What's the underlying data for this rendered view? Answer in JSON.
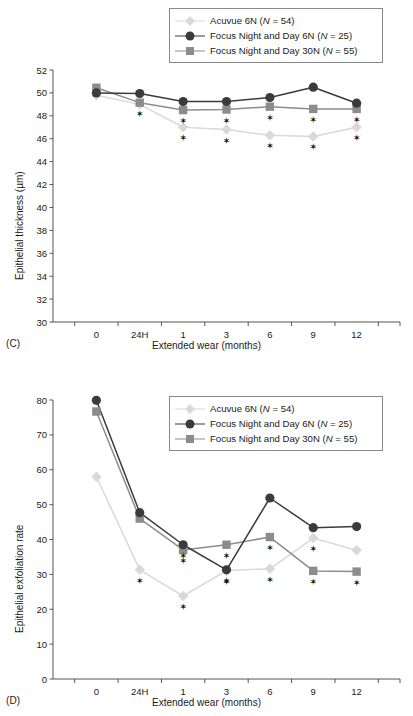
{
  "figure": {
    "panels": [
      {
        "tag": "(C)",
        "chart_key": "panel_c"
      },
      {
        "tag": "(D)",
        "chart_key": "panel_d"
      }
    ]
  },
  "legend": {
    "position": "top-center",
    "entries": [
      {
        "name": "Acuvue 6N",
        "n_prefix": "(",
        "n_italic": "N",
        "n_rest": " = 54)",
        "label": "Acuvue 6N (N = 54)",
        "color": "#d9d9d9",
        "marker": "diamond"
      },
      {
        "name": "Focus Night and Day 6N",
        "n_prefix": "(",
        "n_italic": "N",
        "n_rest": " = 25)",
        "label": "Focus Night and Day 6N (N = 25)",
        "color": "#3b3b3b",
        "marker": "circle"
      },
      {
        "name": "Focus Night and Day 30N",
        "n_prefix": "(",
        "n_italic": "N",
        "n_rest": " = 55)",
        "label": "Focus Night and Day 30N (N = 55)",
        "color": "#8c8c8c",
        "marker": "square"
      }
    ]
  },
  "colors": {
    "acuvue": "#d9d9d9",
    "fnd6n": "#3b3b3b",
    "fnd30n": "#8c8c8c",
    "axis": "#555555",
    "text": "#1a1a1a",
    "legend_border": "#8a8a8a",
    "star": "#111111",
    "background": "#ffffff"
  },
  "chart_data": [
    {
      "id": "panel_c",
      "panel": "(C)",
      "type": "line",
      "title": "",
      "xlabel": "Extended wear (months)",
      "ylabel": "Epithelial thickness (µm)",
      "categories": [
        "0",
        "24H",
        "1",
        "3",
        "6",
        "9",
        "12"
      ],
      "ylim": [
        30,
        52
      ],
      "yticks": [
        30,
        32,
        34,
        36,
        38,
        40,
        42,
        44,
        46,
        48,
        50,
        52
      ],
      "ytick_labels": [
        "30",
        "32",
        "34",
        "36",
        "38",
        "40",
        "42",
        "44",
        "46",
        "48",
        "50",
        "52"
      ],
      "grid": false,
      "legend": "top-center",
      "series": [
        {
          "name": "Acuvue 6N (N = 54)",
          "key": "acuvue",
          "marker": "diamond",
          "color": "#d9d9d9",
          "values": [
            49.8,
            49.0,
            47.0,
            46.8,
            46.3,
            46.2,
            47.0
          ],
          "significance": [
            false,
            false,
            true,
            true,
            true,
            true,
            true
          ]
        },
        {
          "name": "Focus Night and Day 6N (N = 25)",
          "key": "fnd6n",
          "marker": "circle",
          "color": "#3b3b3b",
          "values": [
            50.0,
            49.95,
            49.25,
            49.25,
            49.6,
            50.5,
            49.1
          ],
          "significance": [
            false,
            false,
            false,
            false,
            false,
            false,
            false
          ]
        },
        {
          "name": "Focus Night and Day 30N (N = 55)",
          "key": "fnd30n",
          "marker": "square",
          "color": "#8c8c8c",
          "values": [
            50.45,
            49.15,
            48.5,
            48.55,
            48.8,
            48.6,
            48.6
          ],
          "significance": [
            false,
            true,
            true,
            true,
            true,
            true,
            true
          ]
        }
      ],
      "annotations": {
        "star_symbol": "✶",
        "star_note": "Asterisks mark statistically significant differences"
      }
    },
    {
      "id": "panel_d",
      "panel": "(D)",
      "type": "line",
      "title": "",
      "xlabel": "Extended wear (months)",
      "ylabel": "Epithelial exfoliation rate",
      "categories": [
        "0",
        "24H",
        "1",
        "3",
        "6",
        "9",
        "12"
      ],
      "ylim": [
        0,
        80
      ],
      "yticks": [
        0,
        10,
        20,
        30,
        40,
        50,
        60,
        70,
        80
      ],
      "ytick_labels": [
        "0",
        "10",
        "20",
        "30",
        "40",
        "50",
        "60",
        "70",
        "80"
      ],
      "grid": false,
      "legend": "top-center",
      "series": [
        {
          "name": "Acuvue 6N (N = 54)",
          "key": "acuvue",
          "marker": "diamond",
          "color": "#d9d9d9",
          "values": [
            58.0,
            31.3,
            23.8,
            31.1,
            31.6,
            40.4,
            36.9
          ],
          "significance": [
            false,
            true,
            true,
            true,
            true,
            true,
            false
          ]
        },
        {
          "name": "Focus Night and Day 6N (N = 25)",
          "key": "fnd6n",
          "marker": "circle",
          "color": "#3b3b3b",
          "values": [
            79.9,
            47.7,
            38.5,
            31.3,
            51.9,
            43.4,
            43.7
          ],
          "significance": [
            false,
            false,
            true,
            true,
            false,
            false,
            false
          ]
        },
        {
          "name": "Focus Night and Day 30N (N = 55)",
          "key": "fnd30n",
          "marker": "square",
          "color": "#8c8c8c",
          "values": [
            76.7,
            46.0,
            37.0,
            38.5,
            40.7,
            31.0,
            30.8
          ],
          "significance": [
            false,
            false,
            true,
            true,
            true,
            true,
            true
          ]
        }
      ],
      "annotations": {
        "star_symbol": "✶",
        "star_note": "Asterisks mark statistically significant differences"
      }
    }
  ]
}
